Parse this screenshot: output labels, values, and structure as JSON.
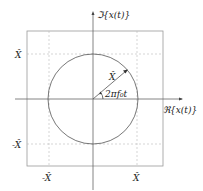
{
  "diagram": {
    "type": "complex-plane phasor",
    "axes": {
      "imag_label": "ℑ{x(t)}",
      "real_label": "ℜ{x(t)}"
    },
    "tick_labels": {
      "y_pos": "X̂",
      "y_neg": "-X̂",
      "x_neg": "-X̂",
      "x_pos": "X̂"
    },
    "phasor": {
      "magnitude_label": "X̂",
      "angle_label": "2πf₀t"
    },
    "colors": {
      "line": "#555555",
      "grid": "#bbbbbb",
      "text": "#222222"
    }
  }
}
